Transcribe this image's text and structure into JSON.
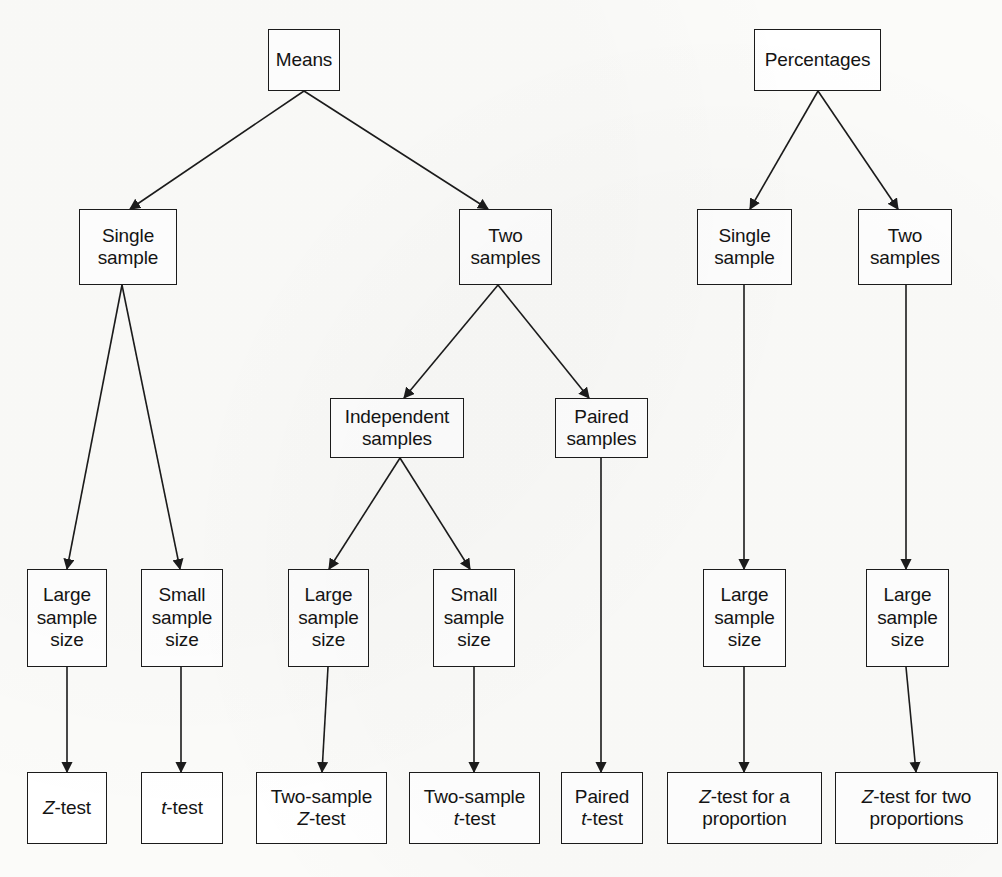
{
  "diagram": {
    "background_color": "#fbfbf9",
    "box_fill_color": "#ffffff",
    "line_color": "#1b1b1b",
    "text_color": "#141414",
    "nodes": [
      {
        "id": "means",
        "label": "Means",
        "x": 268,
        "y": 29,
        "w": 72,
        "h": 62
      },
      {
        "id": "percentages",
        "label": "Percentages",
        "x": 754,
        "y": 29,
        "w": 127,
        "h": 62
      },
      {
        "id": "m-single",
        "label": "Single\nsample",
        "x": 79,
        "y": 209,
        "w": 98,
        "h": 76
      },
      {
        "id": "m-two",
        "label": "Two\nsamples",
        "x": 459,
        "y": 209,
        "w": 93,
        "h": 76
      },
      {
        "id": "p-single",
        "label": "Single\nsample",
        "x": 697,
        "y": 209,
        "w": 95,
        "h": 76
      },
      {
        "id": "p-two",
        "label": "Two\nsamples",
        "x": 858,
        "y": 209,
        "w": 94,
        "h": 76
      },
      {
        "id": "m-independent",
        "label": "Independent\nsamples",
        "x": 330,
        "y": 398,
        "w": 134,
        "h": 60
      },
      {
        "id": "m-paired",
        "label": "Paired\nsamples",
        "x": 555,
        "y": 398,
        "w": 93,
        "h": 60
      },
      {
        "id": "ss-1",
        "label": "Large\nsample\nsize",
        "x": 27,
        "y": 569,
        "w": 80,
        "h": 98
      },
      {
        "id": "ss-2",
        "label": "Small\nsample\nsize",
        "x": 141,
        "y": 569,
        "w": 82,
        "h": 98
      },
      {
        "id": "ss-3",
        "label": "Large\nsample\nsize",
        "x": 288,
        "y": 569,
        "w": 81,
        "h": 98
      },
      {
        "id": "ss-4",
        "label": "Small\nsample\nsize",
        "x": 433,
        "y": 569,
        "w": 82,
        "h": 98
      },
      {
        "id": "ss-5",
        "label": "Large\nsample\nsize",
        "x": 703,
        "y": 569,
        "w": 83,
        "h": 98
      },
      {
        "id": "ss-6",
        "label": "Large\nsample\nsize",
        "x": 866,
        "y": 569,
        "w": 83,
        "h": 98
      },
      {
        "id": "t-z",
        "label": "Z-test",
        "italic_prefix": "Z",
        "x": 27,
        "y": 772,
        "w": 80,
        "h": 72
      },
      {
        "id": "t-t",
        "label": "t-test",
        "italic_prefix": "t",
        "x": 141,
        "y": 772,
        "w": 82,
        "h": 72
      },
      {
        "id": "t-2z",
        "label": "Two-sample\nZ-test",
        "italic_prefix": "Z",
        "x": 256,
        "y": 772,
        "w": 131,
        "h": 72
      },
      {
        "id": "t-2t",
        "label": "Two-sample\nt-test",
        "italic_prefix": "t",
        "x": 409,
        "y": 772,
        "w": 131,
        "h": 72
      },
      {
        "id": "t-pt",
        "label": "Paired\nt-test",
        "italic_prefix": "t",
        "x": 561,
        "y": 772,
        "w": 82,
        "h": 72
      },
      {
        "id": "t-zp",
        "label": "Z-test for a\nproportion",
        "italic_prefix": "Z",
        "x": 667,
        "y": 772,
        "w": 155,
        "h": 72
      },
      {
        "id": "t-z2p",
        "label": "Z-test for two\nproportions",
        "italic_prefix": "Z",
        "x": 835,
        "y": 772,
        "w": 163,
        "h": 72
      }
    ],
    "edges": [
      {
        "id": "e-means-single",
        "from": "means",
        "to": "m-single",
        "x1": 304,
        "y1": 91,
        "x2": 130,
        "y2": 209
      },
      {
        "id": "e-means-two",
        "from": "means",
        "to": "m-two",
        "x1": 304,
        "y1": 91,
        "x2": 488,
        "y2": 209
      },
      {
        "id": "e-pct-single",
        "from": "percentages",
        "to": "p-single",
        "x1": 818,
        "y1": 91,
        "x2": 750,
        "y2": 209
      },
      {
        "id": "e-pct-two",
        "from": "percentages",
        "to": "p-two",
        "x1": 818,
        "y1": 91,
        "x2": 898,
        "y2": 209
      },
      {
        "id": "e-msingle-large",
        "from": "m-single",
        "to": "ss-1",
        "x1": 122,
        "y1": 285,
        "x2": 67,
        "y2": 569
      },
      {
        "id": "e-msingle-small",
        "from": "m-single",
        "to": "ss-2",
        "x1": 122,
        "y1": 285,
        "x2": 180,
        "y2": 569
      },
      {
        "id": "e-mtwo-independent",
        "from": "m-two",
        "to": "m-independent",
        "x1": 498,
        "y1": 285,
        "x2": 404,
        "y2": 398
      },
      {
        "id": "e-mtwo-paired",
        "from": "m-two",
        "to": "m-paired",
        "x1": 498,
        "y1": 285,
        "x2": 589,
        "y2": 398
      },
      {
        "id": "e-indep-large",
        "from": "m-independent",
        "to": "ss-3",
        "x1": 400,
        "y1": 458,
        "x2": 329,
        "y2": 569
      },
      {
        "id": "e-indep-small",
        "from": "m-independent",
        "to": "ss-4",
        "x1": 400,
        "y1": 458,
        "x2": 470,
        "y2": 569
      },
      {
        "id": "e-paired-ttest",
        "from": "m-paired",
        "to": "t-pt",
        "x1": 601,
        "y1": 458,
        "x2": 601,
        "y2": 772
      },
      {
        "id": "e-psingle-large",
        "from": "p-single",
        "to": "ss-5",
        "x1": 744,
        "y1": 285,
        "x2": 744,
        "y2": 569
      },
      {
        "id": "e-ptwo-large",
        "from": "p-two",
        "to": "ss-6",
        "x1": 906,
        "y1": 285,
        "x2": 906,
        "y2": 569
      },
      {
        "id": "e-ss1-ztest",
        "from": "ss-1",
        "to": "t-z",
        "x1": 67,
        "y1": 667,
        "x2": 67,
        "y2": 772
      },
      {
        "id": "e-ss2-ttest",
        "from": "ss-2",
        "to": "t-t",
        "x1": 181,
        "y1": 667,
        "x2": 181,
        "y2": 772
      },
      {
        "id": "e-ss3-2ztest",
        "from": "ss-3",
        "to": "t-2z",
        "x1": 328,
        "y1": 667,
        "x2": 322,
        "y2": 772
      },
      {
        "id": "e-ss4-2ttest",
        "from": "ss-4",
        "to": "t-2t",
        "x1": 474,
        "y1": 667,
        "x2": 474,
        "y2": 772
      },
      {
        "id": "e-ss5-zprop",
        "from": "ss-5",
        "to": "t-zp",
        "x1": 744,
        "y1": 667,
        "x2": 744,
        "y2": 772
      },
      {
        "id": "e-ss6-z2prop",
        "from": "ss-6",
        "to": "t-z2p",
        "x1": 906,
        "y1": 667,
        "x2": 916,
        "y2": 772
      }
    ]
  },
  "chart_data": {
    "type": "diagram",
    "layout": "top-down decision tree, two independent roots",
    "levels": [
      "parameter",
      "number of samples",
      "sample relationship",
      "sample size",
      "test"
    ],
    "trees": [
      {
        "root": "Means",
        "branches": [
          {
            "label": "Single sample",
            "children": [
              {
                "label": "Large sample size",
                "test": "Z-test"
              },
              {
                "label": "Small sample size",
                "test": "t-test"
              }
            ]
          },
          {
            "label": "Two samples",
            "children": [
              {
                "label": "Independent samples",
                "children": [
                  {
                    "label": "Large sample size",
                    "test": "Two-sample Z-test"
                  },
                  {
                    "label": "Small sample size",
                    "test": "Two-sample t-test"
                  }
                ]
              },
              {
                "label": "Paired samples",
                "test": "Paired t-test"
              }
            ]
          }
        ]
      },
      {
        "root": "Percentages",
        "branches": [
          {
            "label": "Single sample",
            "children": [
              {
                "label": "Large sample size",
                "test": "Z-test for a proportion"
              }
            ]
          },
          {
            "label": "Two samples",
            "children": [
              {
                "label": "Large sample size",
                "test": "Z-test for two proportions"
              }
            ]
          }
        ]
      }
    ]
  }
}
